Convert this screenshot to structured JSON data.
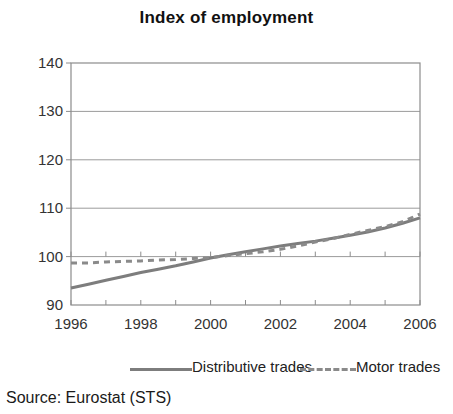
{
  "chart_data": {
    "type": "line",
    "title": "Index of employment",
    "xlabel": "",
    "ylabel": "",
    "xlim": [
      1996,
      2006
    ],
    "ylim": [
      90,
      140
    ],
    "yticks": [
      90,
      100,
      110,
      120,
      130,
      140
    ],
    "xticks": [
      1996,
      1998,
      2000,
      2002,
      2004,
      2006
    ],
    "ytick_labels": [
      "90",
      "100",
      "110",
      "120",
      "130",
      "140"
    ],
    "xtick_labels": [
      "1996",
      "1998",
      "2000",
      "2002",
      "2004",
      "2006"
    ],
    "grid": "horizontal",
    "legend_position": "bottom",
    "x": [
      1996,
      1996.5,
      1997,
      1997.5,
      1998,
      1998.5,
      1999,
      1999.5,
      2000,
      2000.5,
      2001,
      2001.5,
      2002,
      2002.5,
      2003,
      2003.5,
      2004,
      2004.5,
      2005,
      2005.5,
      2006
    ],
    "series": [
      {
        "name": "Distributive trades",
        "style": "solid",
        "color": "#7d7d7d",
        "values": [
          93.5,
          94.3,
          95.1,
          95.9,
          96.7,
          97.4,
          98.1,
          98.9,
          99.7,
          100.4,
          101.0,
          101.6,
          102.2,
          102.7,
          103.2,
          103.8,
          104.4,
          105.1,
          105.9,
          106.9,
          108.0
        ]
      },
      {
        "name": "Motor trades",
        "style": "dashed",
        "color": "#8a8a8a",
        "values": [
          98.7,
          98.7,
          98.9,
          99.0,
          99.1,
          99.3,
          99.4,
          99.6,
          99.8,
          100.2,
          100.6,
          101.0,
          101.5,
          102.2,
          103.0,
          103.7,
          104.6,
          105.4,
          106.2,
          107.2,
          108.8
        ]
      }
    ]
  },
  "legend": {
    "entries": [
      {
        "label": "Distributive trades",
        "style": "solid"
      },
      {
        "label": "Motor trades",
        "style": "dashed"
      }
    ]
  },
  "source": {
    "text": "Source: Eurostat (STS)"
  },
  "colors": {
    "series_solid": "#7d7d7d",
    "series_dashed": "#8a8a8a",
    "grid": "#9b9b9b",
    "axis": "#8c8c8c",
    "text": "#1a1a1a"
  }
}
